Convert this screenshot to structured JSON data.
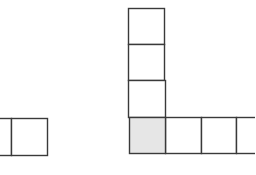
{
  "diagram": {
    "colors": {
      "stroke": "#3a3a3a",
      "shaded_fill": "#e6e6e6",
      "background": "#ffffff"
    },
    "left_shape": {
      "cells": [
        {
          "x": -25,
          "y": 118,
          "w": 36,
          "h": 37,
          "shaded": false
        },
        {
          "x": 11,
          "y": 118,
          "w": 36,
          "h": 37,
          "shaded": false
        }
      ]
    },
    "l_shape": {
      "vertical_column": [
        {
          "x": 128,
          "y": 8,
          "w": 36,
          "h": 36,
          "shaded": false
        },
        {
          "x": 128,
          "y": 44,
          "w": 36,
          "h": 36,
          "shaded": false
        },
        {
          "x": 128,
          "y": 80,
          "w": 37,
          "h": 37,
          "shaded": false
        }
      ],
      "corner": {
        "x": 129,
        "y": 117,
        "w": 36,
        "h": 36,
        "shaded": true
      },
      "horizontal_row": [
        {
          "x": 165,
          "y": 117,
          "w": 36,
          "h": 36,
          "shaded": false
        },
        {
          "x": 201,
          "y": 117,
          "w": 35,
          "h": 36,
          "shaded": false
        },
        {
          "x": 236,
          "y": 117,
          "w": 36,
          "h": 36,
          "shaded": false
        }
      ]
    }
  }
}
